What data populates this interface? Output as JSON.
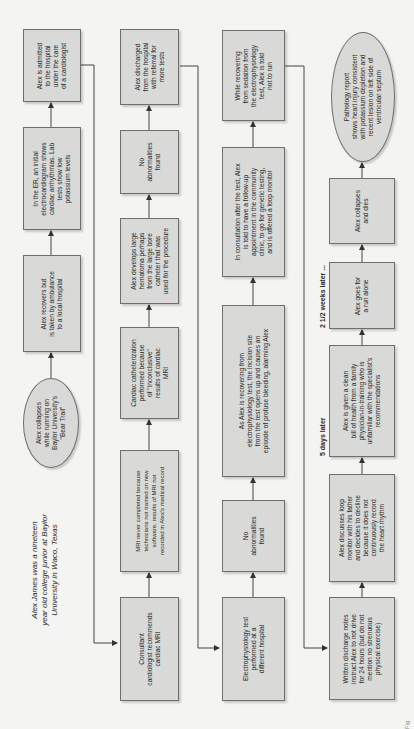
{
  "intro": "Alex James was a nineteen year old college junior at Baylor University in Waco, Texas",
  "intro_lines": [
    "Alex James was a nineteen",
    "year old college junior at Baylor",
    "University in Waco, Texas"
  ],
  "time_labels": {
    "five_days": "5 days later",
    "weeks": "2 1/2 weeks later ..."
  },
  "column1": [
    {
      "id": "collapse",
      "shape": "ellipse",
      "lines": [
        "Alex collapses",
        "while running on",
        "Baylor University's",
        "\"Bear Trail\""
      ]
    },
    {
      "id": "ambulance",
      "shape": "box",
      "lines": [
        "Alex recovers but",
        "is taken by ambulance",
        "to a local hospital"
      ]
    },
    {
      "id": "er",
      "shape": "box",
      "lines": [
        "In the ER, an initial",
        "electrocardiogram shows",
        "cardiac arrhythmias. Lab",
        "tests show low",
        "potassium levels"
      ]
    },
    {
      "id": "admitted",
      "shape": "box",
      "lines": [
        "Alex is admitted",
        "to the hospital",
        "under the care",
        "of a cardiologist"
      ]
    }
  ],
  "column2": [
    {
      "id": "consultant",
      "shape": "box",
      "lines": [
        "Consultant",
        "cardiologist recommends",
        "cardiac MRI"
      ]
    },
    {
      "id": "mri",
      "shape": "box",
      "lines": [
        "MRI never completed because",
        "technicians not trained on new",
        "software; results of MRI not",
        "recorded in  Alex's medical record"
      ]
    },
    {
      "id": "cath",
      "shape": "box",
      "lines": [
        "Cardiac catheterization",
        "performed because",
        "of \"inconclusive\"",
        "results of cardiac",
        "MRI"
      ]
    },
    {
      "id": "hematoma",
      "shape": "box",
      "lines": [
        "Alex develops large",
        "hematoma perhaps",
        "from the large bore",
        "catheter that was",
        "used for the procedure"
      ]
    },
    {
      "id": "noabn1",
      "shape": "box",
      "lines": [
        "No",
        "abnormalities",
        "found"
      ]
    },
    {
      "id": "discharged",
      "shape": "box",
      "lines": [
        "Alex discharged",
        "from the hospital",
        "with referral for",
        "more tests"
      ]
    }
  ],
  "column3": [
    {
      "id": "ep",
      "shape": "box",
      "lines": [
        "Electrophysiology test",
        "performed at a",
        "different hospital"
      ]
    },
    {
      "id": "noabn2",
      "shape": "box",
      "lines": [
        "No",
        "abnormalities",
        "found"
      ]
    },
    {
      "id": "bleeding",
      "shape": "box",
      "lines": [
        "As Alex is recovering from",
        "electrophysiology test, the incision site",
        "from the test opens up and causes an",
        "episode of profuse bleeding, alarming Alex"
      ]
    },
    {
      "id": "consultation",
      "shape": "box",
      "lines": [
        "In consultation after the test, Alex",
        "is told to have a follow-up",
        "appointment in the community",
        "clinic, to go for genetic testing,",
        "and is offered a loop monitor"
      ]
    },
    {
      "id": "sedation",
      "shape": "box",
      "lines": [
        "While recovering",
        "from sedation from",
        "the electrophysiology",
        "test, Alex is told",
        "not to run"
      ]
    }
  ],
  "column4": [
    {
      "id": "written",
      "shape": "box",
      "lines": [
        "Written discharge notes",
        "instruct Alex to not drive",
        "for 24 hours (but do not",
        "mention no strenuous",
        "physical exercise)"
      ]
    },
    {
      "id": "loop",
      "shape": "box",
      "lines": [
        "Alex discusses loop",
        "monitor with his father",
        "and decides to decline",
        "because it does not",
        "continuously record",
        "the heart rhythm"
      ]
    },
    {
      "id": "clean",
      "shape": "box",
      "lines": [
        "Alex is given a clean",
        "bill of health from a family",
        "physician-in-training who is",
        "unfamiliar with the specialist's",
        "recommendations"
      ]
    },
    {
      "id": "run",
      "shape": "box",
      "lines": [
        "Alex goes for",
        "a run alone"
      ]
    },
    {
      "id": "dies",
      "shape": "box",
      "lines": [
        "Alex collapses",
        "and dies"
      ]
    },
    {
      "id": "pathology",
      "shape": "ellipse",
      "lines": [
        "Pathology report",
        "shows heart injury consistent",
        "with potassium depletion and",
        "recent lesion on left side of",
        "ventricular septum"
      ]
    }
  ],
  "caption_fragment": "Fig"
}
